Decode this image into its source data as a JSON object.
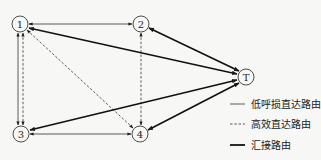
{
  "nodes": [
    {
      "id": "1",
      "label": "1",
      "x": 20,
      "y": 24
    },
    {
      "id": "2",
      "label": "2",
      "x": 141,
      "y": 24
    },
    {
      "id": "3",
      "label": "3",
      "x": 21,
      "y": 134
    },
    {
      "id": "4",
      "label": "4",
      "x": 140,
      "y": 134
    },
    {
      "id": "T",
      "label": "T",
      "x": 246,
      "y": 77
    }
  ],
  "edges": [
    {
      "from": "1",
      "to": "2",
      "type": "low_loss_direct",
      "bidirectional": true
    },
    {
      "from": "3",
      "to": "4",
      "type": "low_loss_direct",
      "bidirectional": true
    },
    {
      "from": "1",
      "to": "3",
      "type": "low_loss_direct",
      "bidirectional": true
    },
    {
      "from": "1",
      "to": "3",
      "type": "high_efficiency_direct",
      "bidirectional": true
    },
    {
      "from": "2",
      "to": "4",
      "type": "high_efficiency_direct",
      "bidirectional": true
    },
    {
      "from": "1",
      "to": "4",
      "type": "high_efficiency_direct",
      "bidirectional": true
    },
    {
      "from": "T",
      "to": "1",
      "type": "tandem",
      "bidirectional": true
    },
    {
      "from": "T",
      "to": "2",
      "type": "tandem",
      "bidirectional": true
    },
    {
      "from": "T",
      "to": "3",
      "type": "tandem",
      "bidirectional": true
    },
    {
      "from": "T",
      "to": "4",
      "type": "tandem",
      "bidirectional": true
    }
  ],
  "legend": {
    "items": [
      {
        "style": "thin-solid",
        "label": "低呼损直达路由"
      },
      {
        "style": "dashed",
        "label": "高效直达路由"
      },
      {
        "style": "thick-solid",
        "label": "汇接路由"
      }
    ]
  },
  "colors": {
    "stroke": "#1a1a1a",
    "background": "#f7f7f5"
  }
}
